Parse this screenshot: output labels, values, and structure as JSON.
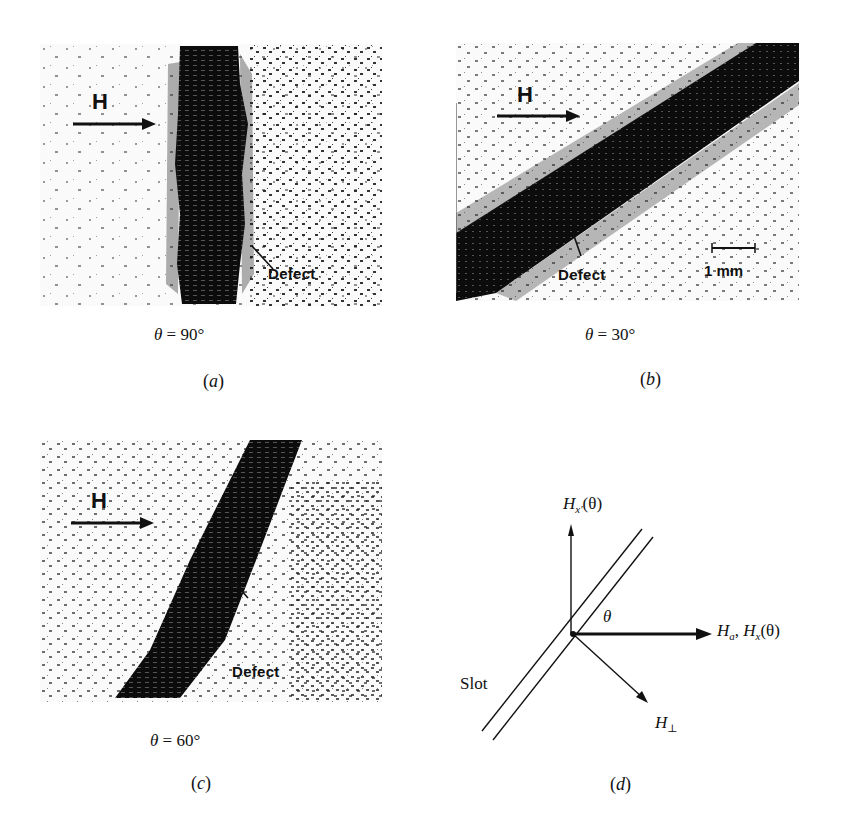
{
  "figure": {
    "panels": [
      {
        "id": "a",
        "tag": "a",
        "field_label": "H",
        "defect_label": "Defect",
        "theta_symbol": "θ",
        "theta_value": "= 90°",
        "slot_angle_deg": 90
      },
      {
        "id": "b",
        "tag": "b",
        "field_label": "H",
        "defect_label": "Defect",
        "scale_bar_label": "1 mm",
        "theta_symbol": "θ",
        "theta_value": "= 30°",
        "slot_angle_deg": 30
      },
      {
        "id": "c",
        "tag": "c",
        "field_label": "H",
        "defect_label": "Defect",
        "theta_symbol": "θ",
        "theta_value": "= 60°",
        "slot_angle_deg": 60
      },
      {
        "id": "d",
        "tag": "d",
        "vertical_axis_label": "H",
        "vertical_axis_sub": "x′",
        "vertical_axis_arg": "(θ)",
        "horizontal_axis_label_1": "H",
        "horizontal_axis_sub_1": "a",
        "horizontal_axis_sep": ", ",
        "horizontal_axis_label_2": "H",
        "horizontal_axis_sub_2": "x",
        "horizontal_axis_arg": "(θ)",
        "angle_label": "θ",
        "perp_label": "H",
        "perp_sub": "⊥",
        "slot_label": "Slot"
      }
    ],
    "paren_open": "(",
    "paren_close": ")"
  }
}
